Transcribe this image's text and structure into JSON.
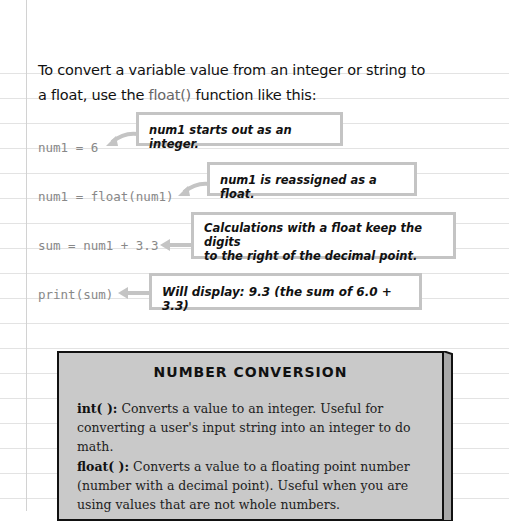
{
  "intro": {
    "line1": "To convert a variable value from an integer or string to",
    "line2_before": "a float, use the ",
    "line2_fn": "float()",
    "line2_after": " function like this:"
  },
  "examples": [
    {
      "code": "num1 = 6",
      "note": "num1 starts out as an integer."
    },
    {
      "code": "num1 = float(num1)",
      "note": "num1 is reassigned as a float."
    },
    {
      "code": "sum = num1 + 3.3",
      "note_line1": "Calculations with a float keep the digits",
      "note_line2": "to the right of the decimal point."
    },
    {
      "code": "print(sum)",
      "note": "Will display: 9.3 (the sum of 6.0 + 3.3)"
    }
  ],
  "sidebar_box": {
    "title": "NUMBER CONVERSION",
    "items": [
      {
        "term": "int( ):",
        "desc": " Converts a value to an integer. Useful for converting a user's input string into an integer to do math."
      },
      {
        "term": "float( ):",
        "desc": " Converts a value to a floating point number (number with a decimal point). Useful when you are using values that are not whole numbers."
      }
    ]
  },
  "colors": {
    "paper_rule": "#e3e3e3",
    "callout_border": "#c4c4c4",
    "box_fill": "#c9c9c9",
    "code_text": "#888888"
  }
}
